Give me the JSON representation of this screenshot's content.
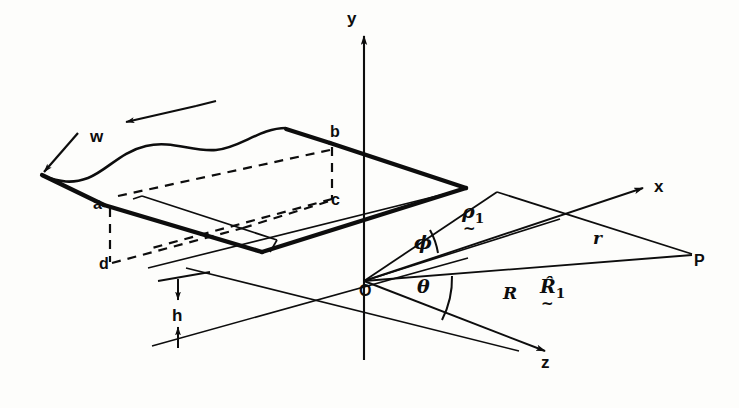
{
  "figure": {
    "kind": "3d-coordinate-diagram"
  },
  "axes": [
    {
      "name": "y-axis",
      "label": "y",
      "direction": "up"
    },
    {
      "name": "x-axis",
      "label": "x",
      "direction": "up-right"
    },
    {
      "name": "z-axis",
      "label": "z",
      "direction": "down-right"
    }
  ],
  "origin": {
    "label": "O",
    "name": "origin"
  },
  "points": [
    {
      "id": "a",
      "label": "a",
      "note": "near-left plate corner"
    },
    {
      "id": "b",
      "label": "b",
      "note": "far-right plate corner"
    },
    {
      "id": "c",
      "label": "c",
      "note": "projection of b onto lower plane"
    },
    {
      "id": "d",
      "label": "d",
      "note": "projection of a onto lower plane"
    },
    {
      "id": "P",
      "label": "P",
      "note": "field point"
    }
  ],
  "dimensions": [
    {
      "id": "w",
      "label": "w",
      "note": "plate width, double-headed arrow"
    },
    {
      "id": "h",
      "label": "h",
      "note": "height above plane, vertical double-headed arrow"
    }
  ],
  "angles": [
    {
      "id": "phi",
      "label": "ϕ",
      "note": "angle between rho-1 vector and R vector"
    },
    {
      "id": "theta",
      "label": "θ",
      "note": "angle between R vector and z-axis"
    }
  ],
  "vectors": [
    {
      "id": "rho1",
      "symbol": "ρ",
      "subscript": "1",
      "underline": "~",
      "note": "source position vector"
    },
    {
      "id": "Rhat1",
      "symbol": "R̂",
      "subscript": "1",
      "underline": "~",
      "note": "unit vector along R"
    }
  ],
  "scalars": [
    {
      "id": "R",
      "label": "R",
      "note": "distance from origin to field point"
    },
    {
      "id": "r",
      "label": "r",
      "note": "distance from source element to field point"
    }
  ],
  "colors": {
    "ink": "#0d0d0d",
    "paper": "#fdfdfb"
  }
}
